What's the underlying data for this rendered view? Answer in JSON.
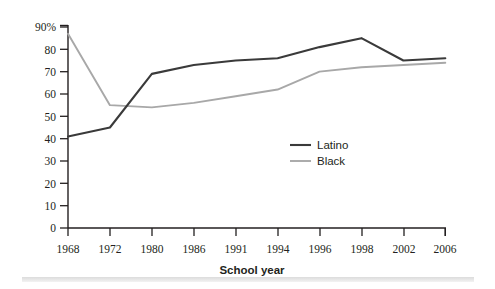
{
  "chart_data": {
    "type": "line",
    "title": "",
    "xlabel": "School year",
    "ylabel": "",
    "x": [
      "1968",
      "1972",
      "1980",
      "1986",
      "1991",
      "1994",
      "1996",
      "1998",
      "2002",
      "2006"
    ],
    "categories": [
      "1968",
      "1972",
      "1980",
      "1986",
      "1991",
      "1994",
      "1996",
      "1998",
      "2002",
      "2006"
    ],
    "series": [
      {
        "name": "Latino",
        "color": "#3a3a3a",
        "values": [
          41,
          45,
          69,
          73,
          75,
          76,
          81,
          85,
          75,
          76
        ]
      },
      {
        "name": "Black",
        "color": "#a8a8a8",
        "values": [
          87,
          55,
          54,
          56,
          59,
          62,
          70,
          72,
          73,
          74
        ]
      }
    ],
    "ylim": [
      0,
      90
    ],
    "yticks": [
      0,
      10,
      20,
      30,
      40,
      50,
      60,
      70,
      80,
      90
    ],
    "ytick_labels": [
      "0",
      "10",
      "20",
      "30",
      "40",
      "50",
      "60",
      "70",
      "80",
      "90%"
    ],
    "grid": false,
    "legend_position": "center-right-inside"
  },
  "legend": {
    "items": [
      {
        "label": "Latino",
        "color": "#3a3a3a"
      },
      {
        "label": "Black",
        "color": "#a8a8a8"
      }
    ]
  },
  "axes": {
    "x_title": "School year"
  },
  "colors": {
    "axis": "#231f20",
    "latino": "#3a3a3a",
    "black": "#a8a8a8",
    "text": "#231f20",
    "background": "#ffffff",
    "bottom_bar": "#e2e2e2"
  }
}
